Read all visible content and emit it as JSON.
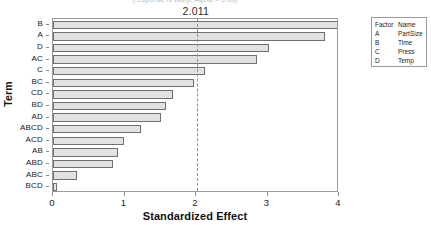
{
  "chart_data": {
    "type": "bar",
    "orientation": "horizontal",
    "title": "",
    "subtitle": "(response is Warp, Alpha = 0.05)",
    "xlabel": "Standardized Effect",
    "ylabel": "Term",
    "xlim": [
      0,
      4.0
    ],
    "xticks": [
      0,
      1,
      2,
      3,
      4
    ],
    "xtick_labels": [
      "0",
      "1",
      "2",
      "3",
      "4"
    ],
    "grid": false,
    "legend_position": "right-outside",
    "reference_line": {
      "value": 2.011,
      "label": "2.011",
      "style": "dashed"
    },
    "categories": [
      "B",
      "A",
      "D",
      "AC",
      "C",
      "BC",
      "CD",
      "BD",
      "AD",
      "ABCD",
      "ACD",
      "AB",
      "ABD",
      "ABC",
      "BCD"
    ],
    "values": [
      3.99,
      3.8,
      3.02,
      2.85,
      2.13,
      1.97,
      1.68,
      1.58,
      1.51,
      1.23,
      0.99,
      0.91,
      0.84,
      0.34,
      0.05
    ],
    "bar_fill": "#e2e2e2",
    "bar_edge": "#6f6f6f"
  },
  "legend": {
    "header": {
      "factor": "Factor",
      "name": "Name"
    },
    "rows": [
      {
        "factor": "A",
        "name": "PartSize"
      },
      {
        "factor": "B",
        "name": "Time"
      },
      {
        "factor": "C",
        "name": "Press"
      },
      {
        "factor": "D",
        "name": "Temp"
      }
    ]
  }
}
